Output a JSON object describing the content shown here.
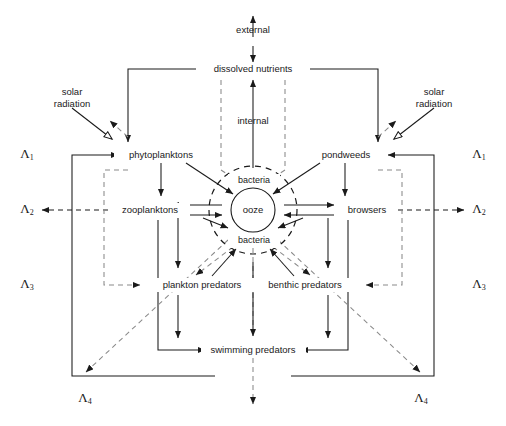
{
  "diagram": {
    "nodes": {
      "external": "external",
      "dissolved_nutrients": "dissolved nutrients",
      "internal": "internal",
      "solar_left": "solar\nradiation",
      "solar_left_line1": "solar",
      "solar_left_line2": "radiation",
      "solar_right_line1": "solar",
      "solar_right_line2": "radiation",
      "phytoplanktons": "phytoplanktons",
      "pondweeds": "pondweeds",
      "zooplanktons": "zooplanktons",
      "browsers": "browsers",
      "bacteria_top": "bacteria",
      "bacteria_bottom": "bacteria",
      "ooze": "ooze",
      "plankton_predators": "plankton predators",
      "benthic_predators": "benthic predators",
      "swimming_predators": "swimming predators"
    },
    "lambdas": {
      "l1": "Λ",
      "l1_sub": "1",
      "l2": "Λ",
      "l2_sub": "2",
      "l3": "Λ",
      "l3_sub": "3",
      "l4": "Λ",
      "l4_sub": "4"
    },
    "colors": {
      "ink": "#1a1a1a",
      "dashed_gray": "#8a8a8a",
      "background": "#ffffff"
    }
  }
}
